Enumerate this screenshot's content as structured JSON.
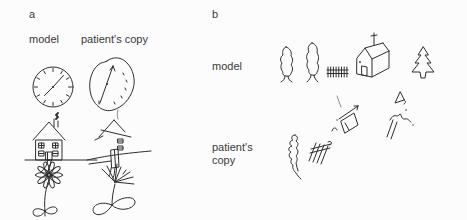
{
  "panel_a": {
    "label": "a",
    "model_header": "model",
    "copy_header": "patient's copy",
    "items": [
      "clock",
      "house",
      "flower"
    ]
  },
  "panel_b": {
    "label": "b",
    "model_label": "model",
    "copy_label": "patient's copy",
    "items": [
      "tree",
      "tree",
      "fence",
      "house",
      "pine-tree"
    ]
  },
  "colors": {
    "ink": "#2e2e2e",
    "text": "#3a3a3a",
    "background": "#fcfcfc"
  }
}
